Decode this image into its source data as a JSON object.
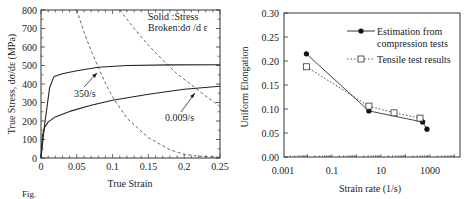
{
  "chart_data": [
    {
      "type": "line",
      "title": "",
      "xlabel": "True Strain",
      "ylabel": "True Stress, dσ/dε (MPa)",
      "xlim": [
        0,
        0.25
      ],
      "ylim": [
        0,
        800
      ],
      "xticks": [
        "0",
        "0.05",
        "0.1",
        "0.15",
        "0.2",
        "0.25"
      ],
      "yticks": [
        "0",
        "100",
        "200",
        "300",
        "400",
        "500",
        "600",
        "700",
        "800"
      ],
      "legend_text": [
        "Solid   :Stress",
        "Broken:dσ /d ε"
      ],
      "annotations": [
        "350/s",
        "0.009/s"
      ],
      "series": [
        {
          "name": "Stress 350/s",
          "style": "solid",
          "x": [
            0,
            0.005,
            0.012,
            0.018,
            0.03,
            0.05,
            0.08,
            0.12,
            0.18,
            0.25
          ],
          "y": [
            0,
            180,
            380,
            440,
            455,
            472,
            490,
            500,
            503,
            504
          ]
        },
        {
          "name": "Stress 0.009/s",
          "style": "solid",
          "x": [
            0,
            0.002,
            0.005,
            0.01,
            0.02,
            0.04,
            0.07,
            0.1,
            0.15,
            0.2,
            0.25
          ],
          "y": [
            0,
            120,
            165,
            195,
            222,
            252,
            285,
            312,
            345,
            372,
            388
          ]
        },
        {
          "name": "dσ/dε 350/s",
          "style": "dashed",
          "x": [
            0.05,
            0.06,
            0.07,
            0.08,
            0.09,
            0.1,
            0.12,
            0.15,
            0.18,
            0.2,
            0.22,
            0.25
          ],
          "y": [
            800,
            680,
            580,
            490,
            405,
            330,
            215,
            110,
            45,
            20,
            10,
            5
          ]
        },
        {
          "name": "dσ/dε 0.009/s",
          "style": "dashed",
          "x": [
            0.11,
            0.13,
            0.15,
            0.17,
            0.19,
            0.21,
            0.23,
            0.25
          ],
          "y": [
            800,
            700,
            610,
            530,
            455,
            395,
            335,
            280
          ]
        }
      ]
    },
    {
      "type": "line",
      "title": "",
      "xlabel": "Strain rate (1/s)",
      "ylabel": "Uniform Elongation",
      "xscale": "log",
      "xlim": [
        0.001,
        20000
      ],
      "ylim": [
        0,
        0.3
      ],
      "xticks": [
        "0.001",
        "0.1",
        "10",
        "1000"
      ],
      "yticks": [
        "0.00",
        "0.05",
        "0.10",
        "0.15",
        "0.20",
        "0.25",
        "0.30"
      ],
      "legend": [
        "Estimation from compression tests",
        "Tensile test results"
      ],
      "series": [
        {
          "name": "Estimation from compression tests",
          "marker": "filled-circle",
          "style": "solid",
          "x": [
            0.009,
            3.2,
            500,
            750
          ],
          "y": [
            0.215,
            0.096,
            0.073,
            0.058
          ]
        },
        {
          "name": "Tensile test results",
          "marker": "open-square",
          "style": "dotted",
          "x": [
            0.009,
            3.2,
            34,
            390
          ],
          "y": [
            0.188,
            0.106,
            0.092,
            0.081
          ]
        }
      ]
    }
  ],
  "caption_fragment": "Fig."
}
